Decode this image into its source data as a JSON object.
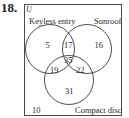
{
  "problem": {
    "number": "18."
  },
  "venn": {
    "universe_label": "U",
    "sets": [
      {
        "name": "Keyless entry"
      },
      {
        "name": "Sunroof"
      },
      {
        "name": "Compact disc"
      }
    ],
    "regions": {
      "keyless_only": "5",
      "sunroof_only": "16",
      "compact_disc_only": "31",
      "keyless_and_sunroof_only": "17",
      "keyless_and_compact_disc_only": "19",
      "sunroof_and_compact_disc_only": "22",
      "all_three": "35",
      "none": "10"
    },
    "colors": {
      "line": "#3a3a3a",
      "text": "#2a2a2a",
      "background": "#ffffff"
    }
  }
}
